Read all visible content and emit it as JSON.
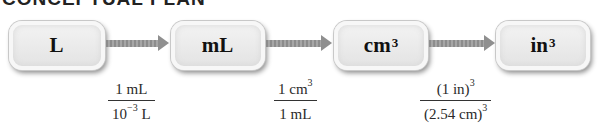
{
  "title": "CONCEPTUAL PLAN",
  "nodes": [
    {
      "base": "L",
      "exp": ""
    },
    {
      "base": "mL",
      "exp": ""
    },
    {
      "base": "cm",
      "exp": "3"
    },
    {
      "base": "in",
      "exp": "3"
    }
  ],
  "conversions": [
    {
      "num_base": "1 mL",
      "num_exp": "",
      "den_pre": "10",
      "den_exp": "−3",
      "den_post": " L"
    },
    {
      "num_base": "1 cm",
      "num_exp": "3",
      "den_pre": "1 mL",
      "den_exp": "",
      "den_post": ""
    },
    {
      "num_base": "(1 in)",
      "num_exp": "3",
      "den_pre": "(2.54 cm)",
      "den_exp": "3",
      "den_post": ""
    }
  ],
  "colors": {
    "arrow": "#8f8f8f",
    "box_fill": "#e8e8e8",
    "text": "#1a1a1a"
  }
}
